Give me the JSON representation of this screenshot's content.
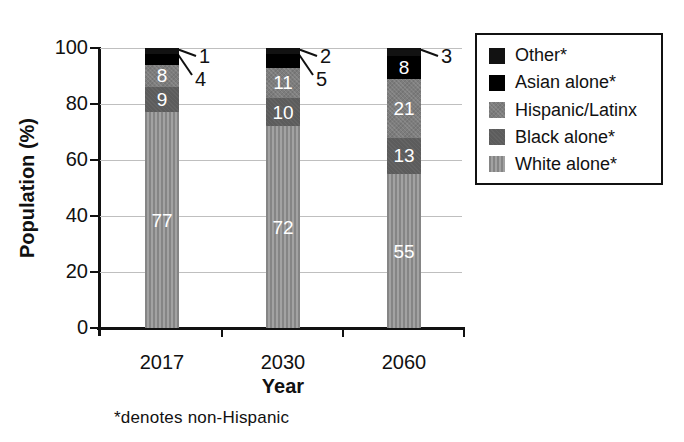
{
  "chart_data": {
    "type": "bar",
    "stacked": true,
    "title": "",
    "xlabel": "Year",
    "ylabel": "Population (%)",
    "ylim": [
      0,
      100
    ],
    "yticks": [
      0,
      20,
      40,
      60,
      80,
      100
    ],
    "grid": true,
    "legend_position": "outside-upper-right",
    "categories": [
      "2017",
      "2030",
      "2060"
    ],
    "series": [
      {
        "name": "White alone*",
        "values": [
          77,
          72,
          55
        ]
      },
      {
        "name": "Black alone*",
        "values": [
          9,
          10,
          13
        ]
      },
      {
        "name": "Hispanic/Latinx",
        "values": [
          8,
          11,
          21
        ]
      },
      {
        "name": "Asian alone*",
        "values": [
          4,
          5,
          8
        ]
      },
      {
        "name": "Other*",
        "values": [
          1,
          2,
          3
        ]
      }
    ],
    "legend_entries": [
      "Other*",
      "Asian alone*",
      "Hispanic/Latinx",
      "Black alone*",
      "White alone*"
    ],
    "callout_values": {
      "2017": [
        1,
        4
      ],
      "2030": [
        2,
        5
      ],
      "2060": [
        3
      ]
    },
    "footnote": "*denotes non-Hispanic"
  },
  "colors": {
    "other": "#121212",
    "asian": "#000000",
    "hispanic": "#7d7d7d",
    "black_alone": "#5c5c5c",
    "white_alone": "#858585",
    "white_alone_stripe": "#a2a2a2",
    "grid": "#bfbfbf",
    "axis": "#111111",
    "text": "#111111",
    "bar_label": "#ffffff",
    "bg": "#ffffff"
  }
}
